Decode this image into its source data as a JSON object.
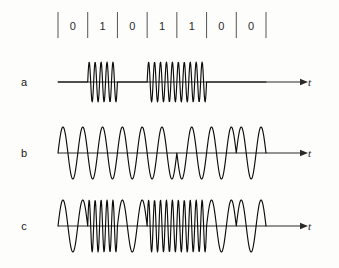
{
  "figure": {
    "background_color": "#fdfdfc",
    "stroke_color": "#0d0d0d",
    "axis_color": "#2a2a2a",
    "tick_color": "#555555"
  },
  "bitstream": {
    "bits": [
      "0",
      "1",
      "0",
      "1",
      "1",
      "0",
      "0"
    ],
    "bit_count": 7,
    "start_x": 58,
    "end_x": 266,
    "label_y": 30,
    "tick_top": 12,
    "tick_bottom": 38
  },
  "rows": [
    {
      "id": "row-a",
      "label": "a",
      "label_x": 24,
      "label_y": 86,
      "modulation": "ASK",
      "baseline_y": 82,
      "axis_x1": 58,
      "axis_x2": 300,
      "axis_label": "t",
      "axis_label_x": 308,
      "axis_label_y": 86,
      "amplitude": 20,
      "cycles_per_bit_mark": 5,
      "cycles_per_bit_space": 0,
      "wave_end_x": 266
    },
    {
      "id": "row-b",
      "label": "b",
      "label_x": 24,
      "label_y": 157,
      "modulation": "PSK",
      "baseline_y": 153,
      "axis_x1": 58,
      "axis_x2": 300,
      "axis_label": "t",
      "axis_label_x": 308,
      "axis_label_y": 157,
      "amplitude": 26,
      "cycles_per_bit": 1.5,
      "phase_mark_deg": 180,
      "phase_space_deg": 0,
      "wave_end_x": 266
    },
    {
      "id": "row-c",
      "label": "c",
      "label_x": 24,
      "label_y": 230,
      "modulation": "FSK",
      "baseline_y": 226,
      "axis_x1": 58,
      "axis_x2": 300,
      "axis_label": "t",
      "axis_label_x": 308,
      "axis_label_y": 230,
      "amplitude": 26,
      "cycles_per_bit_mark": 5,
      "cycles_per_bit_space": 1.5,
      "wave_end_x": 266
    }
  ],
  "chart_data": {
    "type": "line",
    "xlabel": "t",
    "ylabel": "",
    "categories": [
      "0",
      "1",
      "0",
      "1",
      "1",
      "0",
      "0"
    ],
    "series": [
      {
        "name": "a",
        "modulation": "ASK",
        "description": "Amplitude shift keying: carrier burst present for bit 1, zero amplitude for bit 0",
        "cycles_per_bit": [
          0,
          5,
          0,
          5,
          5,
          0,
          0
        ],
        "amplitude_per_bit": [
          0,
          1,
          0,
          1,
          1,
          0,
          0
        ]
      },
      {
        "name": "b",
        "modulation": "PSK",
        "description": "Phase shift keying: constant amplitude and frequency, 180 degree phase reversal between 0 and 1",
        "cycles_per_bit": [
          1.5,
          1.5,
          1.5,
          1.5,
          1.5,
          1.5,
          1.5
        ],
        "phase_per_bit_deg": [
          0,
          180,
          0,
          180,
          180,
          0,
          0
        ]
      },
      {
        "name": "c",
        "modulation": "FSK",
        "description": "Frequency shift keying: low frequency for bit 0, high frequency for bit 1",
        "cycles_per_bit": [
          1.5,
          5,
          1.5,
          5,
          5,
          1.5,
          1.5
        ],
        "amplitude_per_bit": [
          1,
          1,
          1,
          1,
          1,
          1,
          1
        ]
      }
    ],
    "grid": false,
    "legend": "none",
    "xlim": [
      0,
      7
    ],
    "ylim": [
      -1,
      1
    ]
  }
}
